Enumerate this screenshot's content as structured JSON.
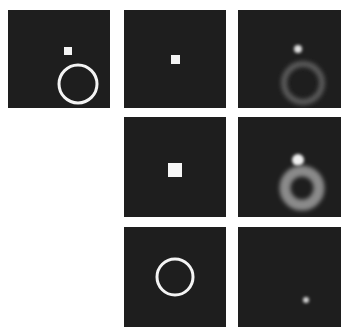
{
  "figure": {
    "layout": {
      "rows": 3,
      "cols": 3
    },
    "background": "#ffffff",
    "panel_color": "#1e1e1e",
    "panels": [
      {
        "id": "r1c1",
        "row": 1,
        "col": 1,
        "x": 8,
        "y": 10,
        "w": 102,
        "h": 98,
        "shapes": [
          {
            "type": "square",
            "x": 64,
            "y": 47,
            "size": 8,
            "color": "#f4f4f4"
          },
          {
            "type": "ring",
            "cx": 78,
            "cy": 84,
            "r": 19,
            "stroke": 3,
            "color": "#f4f4f4"
          }
        ]
      },
      {
        "id": "r1c2",
        "row": 1,
        "col": 2,
        "x": 124,
        "y": 10,
        "w": 102,
        "h": 98,
        "shapes": [
          {
            "type": "square",
            "x": 171,
            "y": 55,
            "size": 9,
            "color": "#f4f4f4"
          }
        ]
      },
      {
        "id": "r1c3",
        "row": 1,
        "col": 3,
        "x": 238,
        "y": 10,
        "w": 103,
        "h": 98,
        "shapes": [
          {
            "type": "blob",
            "cx": 298,
            "cy": 49,
            "r": 4,
            "color": "#e0e0e0"
          },
          {
            "type": "blurred-ring",
            "cx": 303,
            "cy": 83,
            "r": 19,
            "stroke": 6,
            "color": "#5a5a5a"
          }
        ]
      },
      {
        "id": "r2c2",
        "row": 2,
        "col": 2,
        "x": 124,
        "y": 117,
        "w": 102,
        "h": 100,
        "shapes": [
          {
            "type": "square",
            "x": 168,
            "y": 163,
            "size": 14,
            "color": "#f6f6f6"
          }
        ]
      },
      {
        "id": "r2c3",
        "row": 2,
        "col": 3,
        "x": 238,
        "y": 117,
        "w": 103,
        "h": 100,
        "shapes": [
          {
            "type": "blob",
            "cx": 298,
            "cy": 160,
            "r": 6,
            "color": "#f0f0f0"
          },
          {
            "type": "blurred-ring",
            "cx": 302,
            "cy": 188,
            "r": 17,
            "stroke": 11,
            "color": "#8a8a8a"
          }
        ]
      },
      {
        "id": "r3c2",
        "row": 3,
        "col": 2,
        "x": 124,
        "y": 227,
        "w": 102,
        "h": 100,
        "shapes": [
          {
            "type": "ring",
            "cx": 175,
            "cy": 277,
            "r": 18,
            "stroke": 3,
            "color": "#f4f4f4"
          }
        ]
      },
      {
        "id": "r3c3",
        "row": 3,
        "col": 3,
        "x": 238,
        "y": 227,
        "w": 103,
        "h": 100,
        "shapes": [
          {
            "type": "blob",
            "cx": 306,
            "cy": 300,
            "r": 3,
            "color": "#d8d8d8"
          }
        ]
      }
    ]
  }
}
